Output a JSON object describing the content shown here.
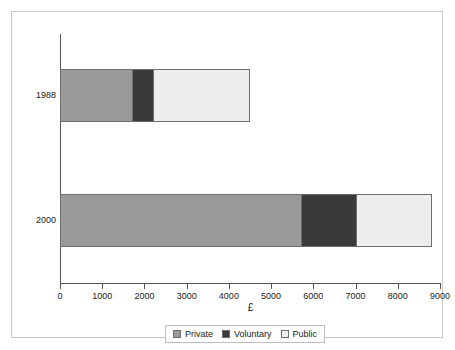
{
  "chart_data": {
    "type": "bar",
    "orientation": "horizontal",
    "stacked": true,
    "title": "",
    "xlabel": "£",
    "ylabel": "",
    "xlim": [
      0,
      9000
    ],
    "grid": false,
    "legend_position": "bottom",
    "categories": [
      "1988",
      "2000"
    ],
    "x_ticks": [
      {
        "value": 0,
        "label": "0"
      },
      {
        "value": 1000,
        "label": "1000"
      },
      {
        "value": 2000,
        "label": "2000"
      },
      {
        "value": 3000,
        "label": "3000"
      },
      {
        "value": 4000,
        "label": "4000"
      },
      {
        "value": 5000,
        "label": "5000"
      },
      {
        "value": 6000,
        "label": "6000"
      },
      {
        "value": 7000,
        "label": "7000"
      },
      {
        "value": 8000,
        "label": "8000"
      },
      {
        "value": 9000,
        "label": "9000"
      }
    ],
    "series": [
      {
        "name": "Private",
        "color": "#9a9a9a",
        "values": [
          1700,
          5700
        ]
      },
      {
        "name": "Voluntary",
        "color": "#3a3a3a",
        "values": [
          500,
          1300
        ]
      },
      {
        "name": "Public",
        "color": "#eeeeee",
        "values": [
          2300,
          1800
        ]
      }
    ],
    "totals": [
      4500,
      8800
    ],
    "bars": [
      {
        "category": "1988",
        "segments": [
          {
            "name": "Private",
            "start": 0,
            "end": 1700,
            "value": 1700,
            "color": "#9a9a9a"
          },
          {
            "name": "Voluntary",
            "start": 1700,
            "end": 2200,
            "value": 500,
            "color": "#3a3a3a"
          },
          {
            "name": "Public",
            "start": 2200,
            "end": 4500,
            "value": 2300,
            "color": "#eeeeee"
          }
        ]
      },
      {
        "category": "2000",
        "segments": [
          {
            "name": "Private",
            "start": 0,
            "end": 5700,
            "value": 5700,
            "color": "#9a9a9a"
          },
          {
            "name": "Voluntary",
            "start": 5700,
            "end": 7000,
            "value": 1300,
            "color": "#3a3a3a"
          },
          {
            "name": "Public",
            "start": 7000,
            "end": 8800,
            "value": 1800,
            "color": "#eeeeee"
          }
        ]
      }
    ],
    "legend": [
      {
        "label": "Private",
        "color": "#9a9a9a"
      },
      {
        "label": "Voluntary",
        "color": "#3a3a3a"
      },
      {
        "label": "Public",
        "color": "#eeeeee"
      }
    ]
  },
  "axis": {
    "x_title": "£"
  }
}
